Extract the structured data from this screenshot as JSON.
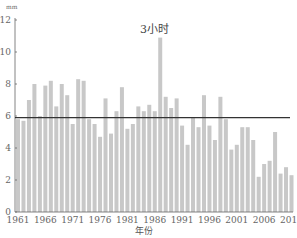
{
  "chart_data": {
    "type": "bar",
    "title": "3小时",
    "xlabel": "年份",
    "ylabel": "mm",
    "ylim": [
      0,
      12
    ],
    "yticks": [
      0,
      2,
      4,
      6,
      8,
      10,
      12
    ],
    "xtick_labels": [
      "1961",
      "1966",
      "1971",
      "1976",
      "1981",
      "1986",
      "1991",
      "1996",
      "2001",
      "2006",
      "2011"
    ],
    "grid": false,
    "legend": null,
    "bar_color": "#c8c8c8",
    "reference_line": {
      "value": 5.9,
      "color": "#333333"
    },
    "categories": [
      "1961",
      "1962",
      "1963",
      "1964",
      "1965",
      "1966",
      "1967",
      "1968",
      "1969",
      "1970",
      "1971",
      "1972",
      "1973",
      "1974",
      "1975",
      "1976",
      "1977",
      "1978",
      "1979",
      "1980",
      "1981",
      "1982",
      "1983",
      "1984",
      "1985",
      "1986",
      "1987",
      "1988",
      "1989",
      "1990",
      "1991",
      "1992",
      "1993",
      "1994",
      "1995",
      "1996",
      "1997",
      "1998",
      "1999",
      "2000",
      "2001",
      "2002",
      "2003",
      "2004",
      "2005",
      "2006",
      "2007",
      "2008",
      "2009",
      "2010",
      "2011"
    ],
    "values": [
      5.8,
      5.7,
      7.0,
      8.0,
      6.0,
      7.9,
      8.2,
      6.6,
      8.0,
      7.3,
      5.5,
      8.3,
      8.2,
      5.8,
      5.5,
      4.7,
      7.1,
      4.9,
      6.3,
      7.8,
      5.2,
      5.5,
      6.6,
      6.3,
      6.7,
      6.3,
      10.9,
      7.2,
      6.5,
      7.1,
      5.4,
      4.2,
      5.9,
      5.3,
      7.3,
      5.4,
      4.5,
      7.2,
      5.8,
      3.9,
      4.2,
      5.3,
      5.3,
      4.5,
      2.2,
      3.0,
      3.2,
      5.0,
      2.4,
      2.8,
      2.3
    ]
  }
}
